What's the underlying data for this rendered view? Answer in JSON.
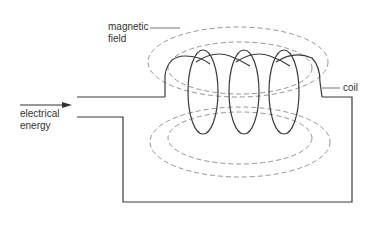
{
  "diagram": {
    "type": "electromagnet-coil",
    "labels": {
      "magnetic_field_line1": "magnetic",
      "magnetic_field_line2": "field",
      "coil": "coil",
      "electrical_energy_line1": "electrical",
      "electrical_energy_line2": "energy"
    },
    "colors": {
      "wire": "#3a3a3a",
      "field_lines": "#8a8a8a",
      "text": "#333333",
      "background": "#ffffff"
    },
    "coil_turns": 3,
    "field_loops": 4
  }
}
